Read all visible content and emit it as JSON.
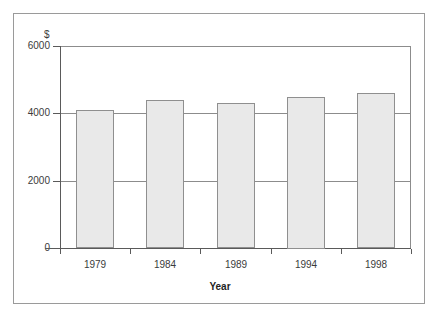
{
  "chart_data": {
    "type": "bar",
    "title": "",
    "subtitle": "",
    "xlabel": "Year",
    "ylabel": "",
    "unit_label": "$",
    "categories": [
      "1979",
      "1984",
      "1989",
      "1994",
      "1998"
    ],
    "values": [
      4100,
      4400,
      4300,
      4500,
      4600
    ],
    "series": [
      {
        "name": "",
        "values": [
          4100,
          4400,
          4300,
          4500,
          4600
        ]
      }
    ],
    "ylim": [
      0,
      6000
    ],
    "yticks": [
      0,
      2000,
      4000,
      6000
    ],
    "ytick_labels": [
      "0",
      "2000",
      "4000",
      "6000"
    ],
    "grid": true,
    "grid_axis": "y",
    "legend": false,
    "legend_position": "none",
    "bar_fill_color": "#e9e9e9",
    "bar_edge_color": "#8f8f8f",
    "axis_color": "#5a5a5a",
    "grid_color": "#8c8c8c",
    "frame_color": "#9a9a9a",
    "background_color": "#ffffff",
    "text_color": "#3b3b3b"
  }
}
